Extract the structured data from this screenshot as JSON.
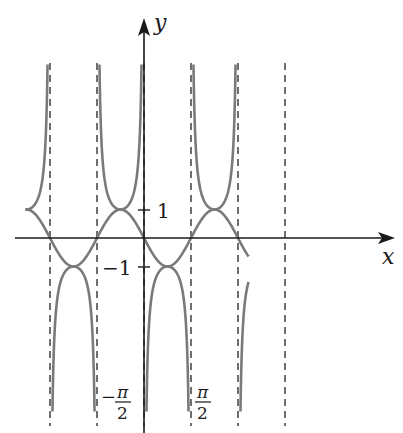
{
  "chart_data": {
    "type": "line",
    "title": "",
    "xlabel": "x",
    "ylabel": "y",
    "x_unit": "pi/2",
    "x_range_units": [
      -5.05,
      4.45
    ],
    "y_range": [
      -6.1,
      6.0
    ],
    "asymptotes_units": [
      -4,
      -2,
      0,
      2,
      4,
      6
    ],
    "y_ticks": [
      {
        "value": 1,
        "label": "1"
      },
      {
        "value": -1,
        "label": "−1"
      }
    ],
    "x_tick_labels": [
      {
        "value_units": -1,
        "label_num": "−π",
        "label_den": "2"
      },
      {
        "value_units": 1,
        "label_num": "π",
        "label_den": "2"
      }
    ],
    "series": [
      {
        "name": "wave",
        "function": "-sin(pi*u/2)",
        "color": "#7a7a7a"
      },
      {
        "name": "reciprocal",
        "function": "-1/sin(pi*u/2)",
        "color": "#7a7a7a"
      }
    ],
    "colors": {
      "axis": "#1a1a1a",
      "curve": "#7a7a7a",
      "asymptote": "#333333"
    }
  },
  "labels": {
    "x_axis": "x",
    "y_axis": "y",
    "tick_pos_one": "1",
    "tick_neg_one": "−1",
    "neg_pi": "−",
    "pi": "π",
    "two": "2"
  }
}
